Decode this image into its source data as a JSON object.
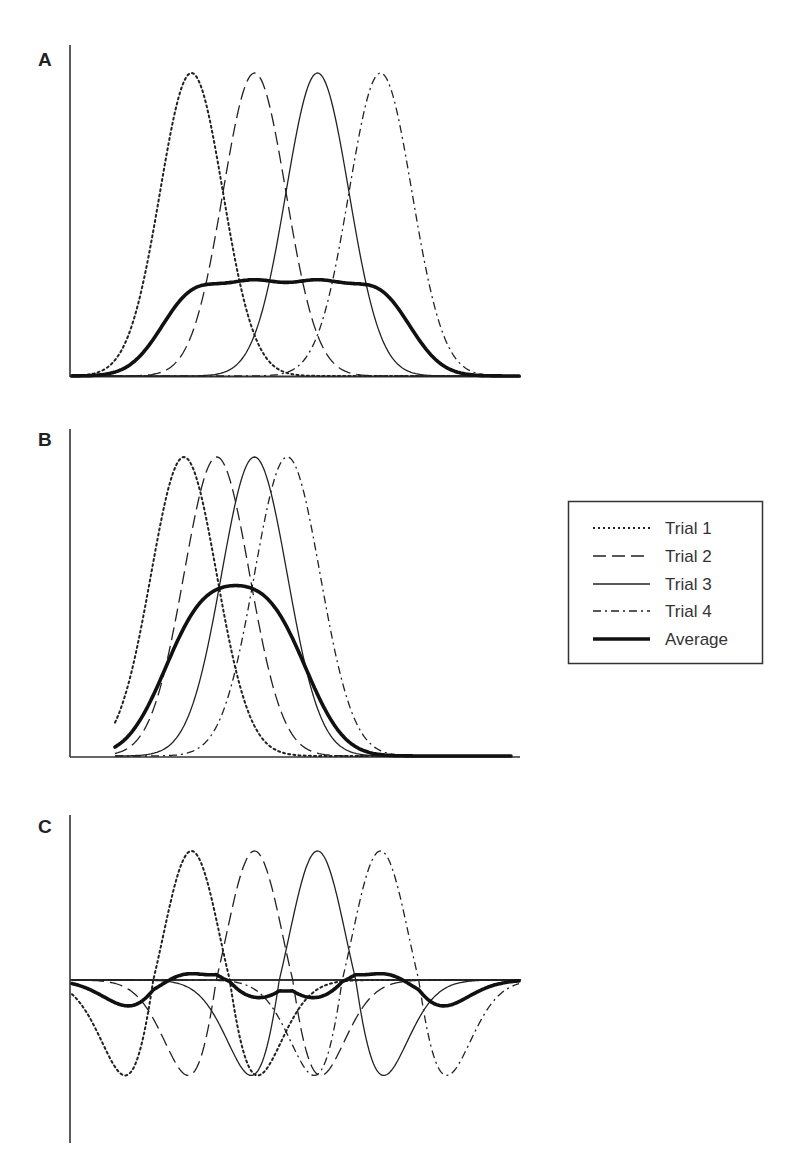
{
  "chart_data": [
    {
      "panel": "A",
      "type": "line",
      "title": "",
      "xlabel": "",
      "ylabel": "",
      "grid": false,
      "description": "Four Gaussian-shaped trial responses with widely spaced peaks; average is a low flat plateau",
      "x_range": [
        0,
        100
      ],
      "y_range": [
        0,
        1
      ],
      "series": [
        {
          "name": "Trial 1",
          "style": "dotted",
          "shape": "gaussian",
          "center": 27,
          "width": 7,
          "peak": 1.0
        },
        {
          "name": "Trial 2",
          "style": "dashed",
          "shape": "gaussian",
          "center": 41,
          "width": 7,
          "peak": 1.0
        },
        {
          "name": "Trial 3",
          "style": "solid",
          "shape": "gaussian",
          "center": 55,
          "width": 7,
          "peak": 1.0
        },
        {
          "name": "Trial 4",
          "style": "dash-dot",
          "shape": "gaussian",
          "center": 69,
          "width": 7,
          "peak": 1.0
        },
        {
          "name": "Average",
          "style": "thick",
          "shape": "mean of trials",
          "peak": 0.38
        }
      ]
    },
    {
      "panel": "B",
      "type": "line",
      "title": "",
      "xlabel": "",
      "ylabel": "",
      "grid": false,
      "description": "Four Gaussian-shaped trial responses with closely spaced peaks; average is a broadened peak",
      "x_range": [
        0,
        100
      ],
      "y_range": [
        0,
        1
      ],
      "series": [
        {
          "name": "Trial 1",
          "style": "dotted",
          "shape": "gaussian",
          "center": 37,
          "width": 7,
          "peak": 1.0
        },
        {
          "name": "Trial 2",
          "style": "dashed",
          "shape": "gaussian",
          "center": 44,
          "width": 7,
          "peak": 1.0
        },
        {
          "name": "Trial 3",
          "style": "solid",
          "shape": "gaussian",
          "center": 52,
          "width": 7,
          "peak": 1.0
        },
        {
          "name": "Trial 4",
          "style": "dash-dot",
          "shape": "gaussian",
          "center": 59,
          "width": 7,
          "peak": 1.0
        },
        {
          "name": "Average",
          "style": "thick",
          "shape": "mean of trials",
          "peak": 0.69
        }
      ]
    },
    {
      "panel": "C",
      "type": "line",
      "title": "",
      "xlabel": "",
      "ylabel": "",
      "grid": false,
      "description": "Four biphasic (Mexican-hat) trial responses with widely spaced peaks; average oscillates near zero",
      "x_range": [
        0,
        100
      ],
      "y_range": [
        -1,
        1
      ],
      "series": [
        {
          "name": "Trial 1",
          "style": "dotted",
          "shape": "ricker",
          "center": 27,
          "width": 8.5,
          "peak": 1.0,
          "trough": -0.74
        },
        {
          "name": "Trial 2",
          "style": "dashed",
          "shape": "ricker",
          "center": 41,
          "width": 8.5,
          "peak": 1.0,
          "trough": -0.74
        },
        {
          "name": "Trial 3",
          "style": "solid",
          "shape": "ricker",
          "center": 55,
          "width": 8.5,
          "peak": 1.0,
          "trough": -0.74
        },
        {
          "name": "Trial 4",
          "style": "dash-dot",
          "shape": "ricker",
          "center": 69,
          "width": 8.5,
          "peak": 1.0,
          "trough": -0.74
        },
        {
          "name": "Average",
          "style": "thick",
          "shape": "mean of trials",
          "peak": 0.22,
          "trough": -0.18
        }
      ]
    }
  ],
  "panels": {
    "A": {
      "label": "A"
    },
    "B": {
      "label": "B"
    },
    "C": {
      "label": "C"
    }
  },
  "legend": {
    "position": "right",
    "items": [
      {
        "label": "Trial 1",
        "style": "dotted"
      },
      {
        "label": "Trial 2",
        "style": "dashed"
      },
      {
        "label": "Trial 3",
        "style": "solid"
      },
      {
        "label": "Trial 4",
        "style": "dash-dot"
      },
      {
        "label": "Average",
        "style": "thick"
      }
    ]
  },
  "colors": {
    "line": "#222222",
    "axis": "#333333",
    "legend_border": "#333333",
    "background": "#ffffff"
  }
}
